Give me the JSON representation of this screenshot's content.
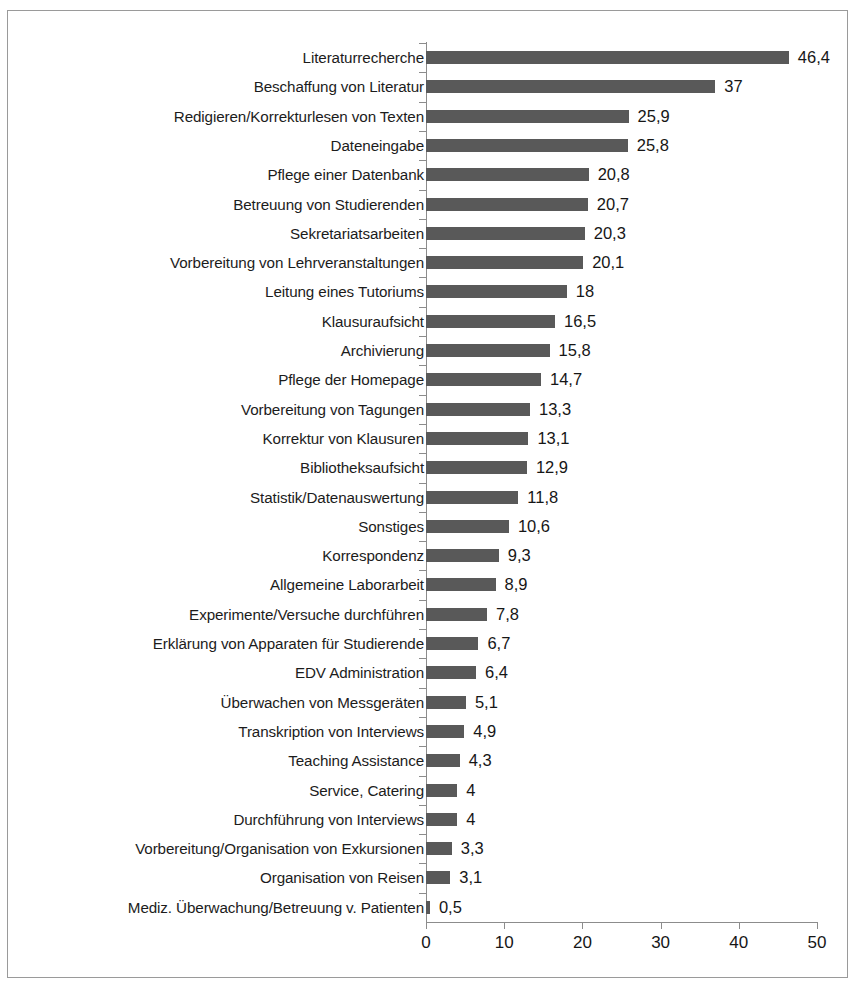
{
  "chart_data": {
    "type": "bar",
    "orientation": "horizontal",
    "title": "",
    "subtitle": "",
    "xlabel": "",
    "ylabel": "",
    "xlim": [
      0,
      50
    ],
    "xticks": [
      "0",
      "10",
      "20",
      "30",
      "40",
      "50"
    ],
    "grid": false,
    "legend": null,
    "decimal_separator": ",",
    "bar_color": "#595959",
    "axis_color": "#8c8c8c",
    "text_color": "#161616",
    "frame_border_color": "#9a9a9a",
    "categories": [
      "Literaturrecherche",
      "Beschaffung von Literatur",
      "Redigieren/Korrekturlesen von Texten",
      "Dateneingabe",
      "Pflege einer Datenbank",
      "Betreuung von Studierenden",
      "Sekretariatsarbeiten",
      "Vorbereitung von Lehrveranstaltungen",
      "Leitung eines Tutoriums",
      "Klausuraufsicht",
      "Archivierung",
      "Pflege der Homepage",
      "Vorbereitung von Tagungen",
      "Korrektur von Klausuren",
      "Bibliotheksaufsicht",
      "Statistik/Datenauswertung",
      "Sonstiges",
      "Korrespondenz",
      "Allgemeine Laborarbeit",
      "Experimente/Versuche durchführen",
      "Erklärung von Apparaten für Studierende",
      "EDV Administration",
      "Überwachen von Messgeräten",
      "Transkription von Interviews",
      "Teaching Assistance",
      "Service, Catering",
      "Durchführung von Interviews",
      "Vorbereitung/Organisation von Exkursionen",
      "Organisation von Reisen",
      "Mediz. Überwachung/Betreuung v. Patienten"
    ],
    "values": [
      46.4,
      37,
      25.9,
      25.8,
      20.8,
      20.7,
      20.3,
      20.1,
      18,
      16.5,
      15.8,
      14.7,
      13.3,
      13.1,
      12.9,
      11.8,
      10.6,
      9.3,
      8.9,
      7.8,
      6.7,
      6.4,
      5.1,
      4.9,
      4.3,
      4,
      4,
      3.3,
      3.1,
      0.5
    ],
    "value_labels": [
      "46,4",
      "37",
      "25,9",
      "25,8",
      "20,8",
      "20,7",
      "20,3",
      "20,1",
      "18",
      "16,5",
      "15,8",
      "14,7",
      "13,3",
      "13,1",
      "12,9",
      "11,8",
      "10,6",
      "9,3",
      "8,9",
      "7,8",
      "6,7",
      "6,4",
      "5,1",
      "4,9",
      "4,3",
      "4",
      "4",
      "3,3",
      "3,1",
      "0,5"
    ]
  }
}
